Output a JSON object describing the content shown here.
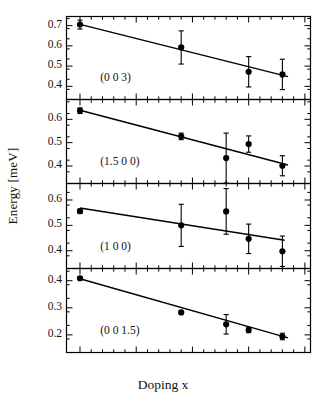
{
  "figure": {
    "xlabel": "Doping x",
    "ylabel": "Energy [meV]",
    "xlim": [
      -0.012,
      0.205
    ],
    "xticks": [
      0,
      0.05,
      0.1,
      0.15,
      0.2
    ],
    "xticklabels": [
      "0",
      "0.05",
      "0.1",
      "0.15",
      "0.2"
    ],
    "axis_color": "#000000",
    "marker_color": "#000000",
    "line_color": "#000000"
  },
  "chart_data": {
    "type": "scatter",
    "title": "",
    "xlabel": "Doping x",
    "ylabel": "Energy [meV]",
    "xlim": [
      -0.012,
      0.205
    ],
    "grid": false,
    "legend": "none",
    "panels": [
      {
        "label": "(0 0 3)",
        "ylim": [
          0.335,
          0.745
        ],
        "yticks": [
          0.7,
          0.6,
          0.5,
          0.4
        ],
        "yticklabels": [
          "0.7",
          "0.6",
          "0.5",
          "0.4"
        ],
        "x": [
          0.0,
          0.09,
          0.15,
          0.18
        ],
        "y": [
          0.705,
          0.592,
          0.472,
          0.459
        ],
        "yerr": [
          0.022,
          0.082,
          0.075,
          0.075
        ],
        "fit": {
          "x": [
            0.0,
            0.185
          ],
          "y": [
            0.706,
            0.448
          ]
        }
      },
      {
        "label": "(1.5 0 0)",
        "ylim": [
          0.325,
          0.685
        ],
        "yticks": [
          0.6,
          0.5,
          0.4
        ],
        "yticklabels": [
          "0.6",
          "0.5",
          "0.4"
        ],
        "x": [
          0.0,
          0.09,
          0.13,
          0.15,
          0.18
        ],
        "y": [
          0.637,
          0.527,
          0.434,
          0.494,
          0.401
        ],
        "yerr": [
          0.012,
          0.014,
          0.107,
          0.035,
          0.043
        ],
        "fit": {
          "x": [
            0.0,
            0.185
          ],
          "y": [
            0.639,
            0.404
          ]
        }
      },
      {
        "label": "(1 0 0)",
        "ylim": [
          0.33,
          0.665
        ],
        "yticks": [
          0.6,
          0.5,
          0.4
        ],
        "yticklabels": [
          "0.6",
          "0.5",
          "0.4"
        ],
        "x": [
          0.0,
          0.09,
          0.13,
          0.15,
          0.18
        ],
        "y": [
          0.556,
          0.5,
          0.555,
          0.447,
          0.398
        ],
        "yerr": [
          0.008,
          0.083,
          0.09,
          0.058,
          0.06
        ],
        "fit": {
          "x": [
            0.0,
            0.182
          ],
          "y": [
            0.568,
            0.441
          ]
        }
      },
      {
        "label": "(0 0 1.5)",
        "ylim": [
          0.135,
          0.445
        ],
        "yticks": [
          0.4,
          0.3,
          0.2
        ],
        "yticklabels": [
          "0.4",
          "0.3",
          "0.2"
        ],
        "x": [
          0.0,
          0.09,
          0.13,
          0.15,
          0.18
        ],
        "y": [
          0.409,
          0.283,
          0.239,
          0.218,
          0.194
        ],
        "yerr": [
          0.006,
          0.006,
          0.036,
          0.01,
          0.012
        ],
        "fit": {
          "x": [
            0.0,
            0.185
          ],
          "y": [
            0.407,
            0.189
          ]
        }
      }
    ]
  }
}
